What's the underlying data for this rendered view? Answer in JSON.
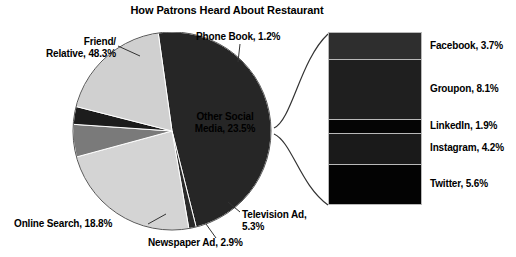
{
  "chart_data": {
    "type": "pie",
    "title": "How Patrons Heard About Restaurant",
    "categories": [
      "Friend/ Relative",
      "Phone Book",
      "Other Social Media",
      "Television Ad",
      "Newspaper Ad",
      "Online Search"
    ],
    "values": [
      48.3,
      1.2,
      23.5,
      5.3,
      2.9,
      18.8
    ],
    "labels": [
      "Friend/\nRelative, 48.3%",
      "Phone Book, 1.2%",
      "Other Social Media, 23.5%",
      "Television Ad, 5.3%",
      "Newspaper Ad, 2.9%",
      "Online Search, 18.8%"
    ],
    "units": "percent",
    "legend": "none",
    "grid": false,
    "secondary_plot": {
      "type": "bar",
      "stacked": true,
      "of_category": "Other Social Media",
      "total": 23.5,
      "categories": [
        "Facebook",
        "Groupon",
        "LinkedIn",
        "Instagram",
        "Twitter"
      ],
      "values": [
        3.7,
        8.1,
        1.9,
        4.2,
        5.6
      ],
      "labels": [
        "Facebook, 3.7%",
        "Groupon, 8.1%",
        "LinkedIn, 1.9%",
        "Instagram, 4.2%",
        "Twitter, 5.6%"
      ]
    }
  },
  "title": "How Patrons Heard About Restaurant",
  "pie": {
    "slices": [
      {
        "name": "friend-relative",
        "label_line1": "Friend/",
        "label_line2": "Relative, 48.3%",
        "value": 48.3,
        "color": "#262626"
      },
      {
        "name": "phone-book",
        "label": "Phone Book, 1.2%",
        "value": 1.2,
        "color": "#2b2b2b"
      },
      {
        "name": "other-social",
        "label": "Other Social Media, 23.5%",
        "value": 23.5,
        "color": "#d4d4d4"
      },
      {
        "name": "television-ad",
        "label": "Television Ad, 5.3%",
        "value": 5.3,
        "color": "#7a7a7a"
      },
      {
        "name": "newspaper-ad",
        "label": "Newspaper Ad, 2.9%",
        "value": 2.9,
        "color": "#1c1c1c"
      },
      {
        "name": "online-search",
        "label": "Online Search, 18.8%",
        "value": 18.8,
        "color": "#d0d0d0"
      }
    ]
  },
  "bar": {
    "segments": [
      {
        "name": "facebook",
        "label": "Facebook, 3.7%",
        "value": 3.7,
        "color": "#2e2e2e"
      },
      {
        "name": "groupon",
        "label": "Groupon, 8.1%",
        "value": 8.1,
        "color": "#1f1f1f"
      },
      {
        "name": "linkedin",
        "label": "LinkedIn, 1.9%",
        "value": 1.9,
        "color": "#050505"
      },
      {
        "name": "instagram",
        "label": "Instagram, 4.2%",
        "value": 4.2,
        "color": "#1a1a1a"
      },
      {
        "name": "twitter",
        "label": "Twitter, 5.6%",
        "value": 5.6,
        "color": "#030303"
      }
    ]
  }
}
